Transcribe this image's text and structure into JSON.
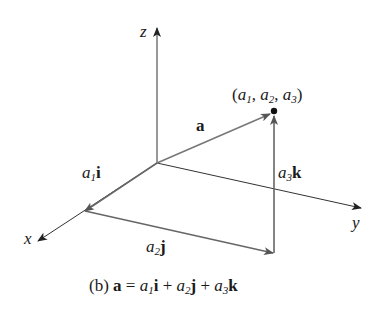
{
  "figure": {
    "caption": {
      "prefix": "(b) ",
      "lhs": "a",
      "eq": " = ",
      "terms": [
        {
          "coef": "a",
          "sub": "1",
          "unit": "i"
        },
        {
          "coef": "a",
          "sub": "2",
          "unit": "j"
        },
        {
          "coef": "a",
          "sub": "3",
          "unit": "k"
        }
      ],
      "plus": " + "
    },
    "axes": {
      "x": "x",
      "y": "y",
      "z": "z"
    },
    "vector_label": "a",
    "point_label": "(a1, a2, a3)",
    "point": {
      "open": "(",
      "parts": [
        {
          "c": "a",
          "s": "1"
        },
        {
          "c": "a",
          "s": "2"
        },
        {
          "c": "a",
          "s": "3"
        }
      ],
      "sep": ", ",
      "close": ")"
    },
    "components": [
      {
        "coef": "a",
        "sub": "1",
        "unit": "i"
      },
      {
        "coef": "a",
        "sub": "2",
        "unit": "j"
      },
      {
        "coef": "a",
        "sub": "3",
        "unit": "k"
      }
    ],
    "colors": {
      "axis": "#333333",
      "vector": "#6e6e6e",
      "text": "#1a1a1a"
    }
  }
}
